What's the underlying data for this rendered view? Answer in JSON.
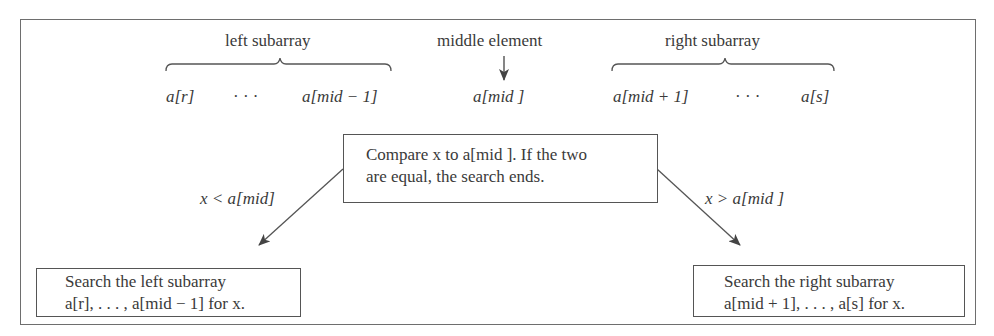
{
  "diagram": {
    "top_labels": {
      "left": "left subarray",
      "middle": "middle element",
      "right": "right subarray"
    },
    "array_row": {
      "left_start": "a[r]",
      "left_dots": "· · ·",
      "left_end": "a[mid − 1]",
      "middle": "a[mid ]",
      "right_start": "a[mid + 1]",
      "right_dots": "· · ·",
      "right_end": "a[s]"
    },
    "center_box": {
      "line1": "Compare x to a[mid ].  If the two",
      "line2": "are equal, the search ends."
    },
    "edges": {
      "left_condition": "x < a[mid]",
      "right_condition": "x > a[mid ]"
    },
    "left_box": {
      "line1": "Search the left subarray",
      "line2": "a[r], . . . , a[mid − 1] for x."
    },
    "right_box": {
      "line1": "Search the right subarray",
      "line2": "a[mid + 1], . . . , a[s] for x."
    },
    "colors": {
      "stroke": "#555555",
      "text": "#3a3a3a",
      "background": "#ffffff"
    }
  }
}
